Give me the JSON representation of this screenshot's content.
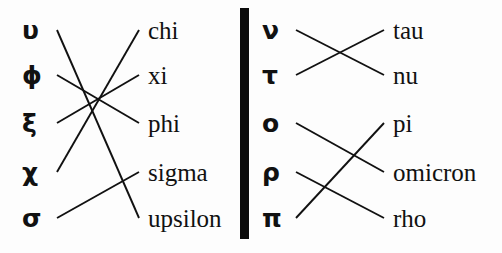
{
  "figure": {
    "background_color": "#fdfdfd",
    "ink_color": "#111111",
    "divider_color": "#0b0b0b",
    "width": 502,
    "height": 253
  },
  "left_panel": {
    "greek_column": [
      {
        "label": "υ",
        "name": "upsilon",
        "y": 30
      },
      {
        "label": "ϕ",
        "name": "phi",
        "y": 75
      },
      {
        "label": "ξ",
        "name": "xi",
        "y": 123
      },
      {
        "label": "χ",
        "name": "chi",
        "y": 172
      },
      {
        "label": "σ",
        "name": "sigma",
        "y": 218
      }
    ],
    "word_column": [
      {
        "label": "chi",
        "y": 30
      },
      {
        "label": "xi",
        "y": 75
      },
      {
        "label": "phi",
        "y": 123
      },
      {
        "label": "sigma",
        "y": 172
      },
      {
        "label": "upsilon",
        "y": 218
      }
    ],
    "connections": [
      {
        "from": "υ",
        "to": "upsilon",
        "x1": 57,
        "y1": 30,
        "x2": 139,
        "y2": 218
      },
      {
        "from": "ϕ",
        "to": "phi",
        "x1": 57,
        "y1": 75,
        "x2": 139,
        "y2": 123
      },
      {
        "from": "ξ",
        "to": "xi",
        "x1": 57,
        "y1": 123,
        "x2": 139,
        "y2": 75
      },
      {
        "from": "χ",
        "to": "chi",
        "x1": 57,
        "y1": 172,
        "x2": 139,
        "y2": 30
      },
      {
        "from": "σ",
        "to": "sigma",
        "x1": 57,
        "y1": 218,
        "x2": 139,
        "y2": 172
      }
    ]
  },
  "right_panel": {
    "greek_column": [
      {
        "label": "ν",
        "name": "nu",
        "y": 30
      },
      {
        "label": "τ",
        "name": "tau",
        "y": 75
      },
      {
        "label": "ο",
        "name": "omicron",
        "y": 123
      },
      {
        "label": "ρ",
        "name": "rho",
        "y": 172
      },
      {
        "label": "π",
        "name": "pi",
        "y": 218
      }
    ],
    "word_column": [
      {
        "label": "tau",
        "y": 30
      },
      {
        "label": "nu",
        "y": 75
      },
      {
        "label": "pi",
        "y": 123
      },
      {
        "label": "omicron",
        "y": 172
      },
      {
        "label": "rho",
        "y": 218
      }
    ],
    "connections": [
      {
        "from": "ν",
        "to": "nu",
        "x1": 44,
        "y1": 30,
        "x2": 132,
        "y2": 75
      },
      {
        "from": "τ",
        "to": "tau",
        "x1": 44,
        "y1": 75,
        "x2": 132,
        "y2": 30
      },
      {
        "from": "ο",
        "to": "omicron",
        "x1": 44,
        "y1": 123,
        "x2": 132,
        "y2": 172
      },
      {
        "from": "ρ",
        "to": "rho",
        "x1": 44,
        "y1": 172,
        "x2": 132,
        "y2": 218
      },
      {
        "from": "π",
        "to": "pi",
        "x1": 44,
        "y1": 218,
        "x2": 132,
        "y2": 123
      }
    ]
  }
}
